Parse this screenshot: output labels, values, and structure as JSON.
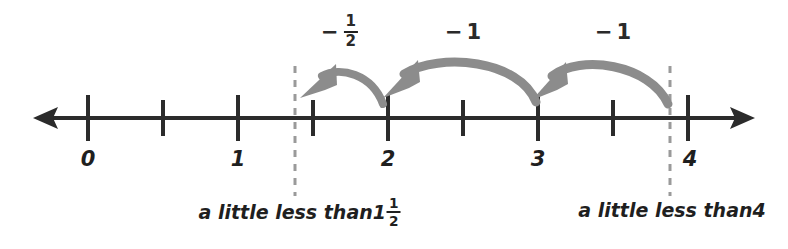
{
  "figure": {
    "type": "number-line-diagram",
    "colors": {
      "axis": "#2b2b2b",
      "hop_arrow": "#8c8c8c",
      "dashed_guide": "#9a9a9a",
      "text": "#1f1f1f",
      "background": "#ffffff"
    }
  },
  "number_line": {
    "min": 0,
    "max": 4,
    "major_tick_step": 1,
    "minor_tick_step": 0.5,
    "tick_labels": [
      {
        "value": "0",
        "position": 0
      },
      {
        "value": "1",
        "position": 1
      },
      {
        "value": "2",
        "position": 2
      },
      {
        "value": "3",
        "position": 3
      },
      {
        "value": "4",
        "position": 4
      }
    ],
    "left_arrow": "arrow-left",
    "right_arrow": "arrow-right"
  },
  "hops": [
    {
      "id": "hop-half",
      "label_minus": "−",
      "label_numerator": "1",
      "label_denominator": "2",
      "label_text": "− 1/2",
      "from": 2,
      "to": 1.37,
      "label_position": 1.68
    },
    {
      "id": "hop-one-middle",
      "label_minus": "−",
      "label_whole": "1",
      "label_text": "−1",
      "from": 3,
      "to": 2,
      "label_position": 2.5
    },
    {
      "id": "hop-one-right",
      "label_minus": "−",
      "label_whole": "1",
      "label_text": "−1",
      "from": 3.88,
      "to": 3,
      "label_position": 3.5
    }
  ],
  "guides": [
    {
      "id": "guide-left",
      "position": 1.38,
      "caption_prefix": "a little less than ",
      "caption_whole": "1",
      "caption_numerator": "1",
      "caption_denominator": "2",
      "caption_text": "a little less than 1 1/2",
      "caption_center": 1.38
    },
    {
      "id": "guide-right",
      "position": 3.88,
      "caption_prefix": "a little less than ",
      "caption_whole": "4",
      "caption_text": "a little less than 4",
      "caption_center": 3.95
    }
  ]
}
